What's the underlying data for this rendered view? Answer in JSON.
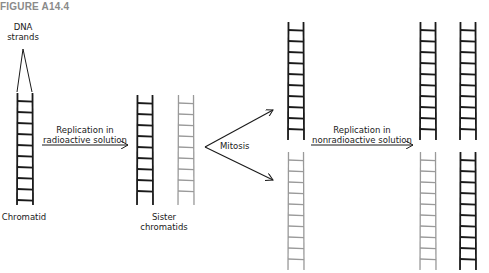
{
  "figure": {
    "title": "FIGURE A14.4"
  },
  "labels": {
    "dna_strands_line1": "DNA",
    "dna_strands_line2": "strands",
    "chromatid": "Chromatid",
    "replication_radioactive_line1": "Replication in",
    "replication_radioactive_line2": "radioactive solution",
    "sister_chromatids_line1": "Sister",
    "sister_chromatids_line2": "chromatids",
    "mitosis": "Mitosis",
    "replication_nonradioactive_line1": "Replication in",
    "replication_nonradioactive_line2": "nonradioactive solution"
  },
  "colors": {
    "unlabeled_strand": "#1a1a1a",
    "radioactive_strand": "#9a9a9a",
    "title": "#8a8a8a"
  },
  "ladders": [
    {
      "id": "original-chromatid",
      "x": 17,
      "y": 93,
      "height": 112,
      "shade": "dark"
    },
    {
      "id": "sister-chromatid-dark",
      "x": 137,
      "y": 95,
      "height": 110,
      "shade": "dark"
    },
    {
      "id": "sister-chromatid-gray",
      "x": 178,
      "y": 95,
      "height": 110,
      "shade": "gray"
    },
    {
      "id": "daughter-top",
      "x": 288,
      "y": 22,
      "height": 118,
      "shade": "dark"
    },
    {
      "id": "daughter-bottom",
      "x": 288,
      "y": 152,
      "height": 118,
      "shade": "gray"
    },
    {
      "id": "final-top-left",
      "x": 420,
      "y": 22,
      "height": 118,
      "shade": "dark"
    },
    {
      "id": "final-top-right",
      "x": 460,
      "y": 22,
      "height": 118,
      "shade": "dark"
    },
    {
      "id": "final-bottom-left",
      "x": 420,
      "y": 152,
      "height": 118,
      "shade": "gray"
    },
    {
      "id": "final-bottom-right",
      "x": 460,
      "y": 152,
      "height": 118,
      "shade": "dark"
    }
  ]
}
